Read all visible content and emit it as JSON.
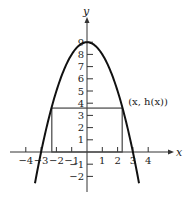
{
  "chart_data": {
    "type": "line",
    "title": "",
    "xlabel": "x",
    "ylabel": "y",
    "function": "h(x) = 9 - x^2",
    "x_ticks": [
      -4,
      -3,
      -2,
      -1,
      1,
      2,
      3,
      4
    ],
    "x_tick_labels": [
      "−4",
      "−3",
      "−2",
      "−1",
      "1",
      "2",
      "3",
      "4"
    ],
    "y_ticks": [
      -2,
      -1,
      1,
      2,
      3,
      4,
      5,
      6,
      7,
      8,
      9
    ],
    "y_tick_labels": [
      "−2",
      "−1",
      "1",
      "2",
      "3",
      "4",
      "5",
      "6",
      "7",
      "8",
      "9"
    ],
    "xlim": [
      -5,
      5
    ],
    "ylim": [
      -3,
      10
    ],
    "grid": false,
    "series": [
      {
        "name": "h(x)",
        "x": [
          -3.4,
          -3,
          -2.5,
          -2,
          -1.5,
          -1,
          -0.5,
          0,
          0.5,
          1,
          1.5,
          2,
          2.5,
          3,
          3.4
        ],
        "y": [
          -2.56,
          0,
          2.75,
          5,
          6.75,
          8,
          8.75,
          9,
          8.75,
          8,
          6.75,
          5,
          2.75,
          0,
          -2.56
        ]
      }
    ],
    "rectangle": {
      "x_left": -2.3,
      "x_right": 2.3,
      "height": 3.6
    },
    "annotations": [
      {
        "text": "(x, h(x))",
        "x": 2.3,
        "y": 3.6
      }
    ]
  }
}
